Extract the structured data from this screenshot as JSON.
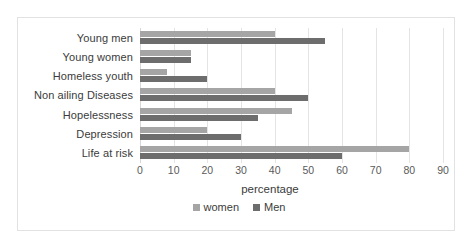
{
  "chart_data": {
    "type": "bar",
    "orientation": "horizontal",
    "title": "",
    "xlabel": "percentage",
    "ylabel": "",
    "xlim": [
      0,
      90
    ],
    "xticks": [
      0,
      10,
      20,
      30,
      40,
      50,
      60,
      70,
      80,
      90
    ],
    "grid": "vertical",
    "legend_position": "bottom",
    "categories": [
      "Young men",
      "Young women",
      "Homeless youth",
      "Non ailing Diseases",
      "Hopelessness",
      "Depression",
      "Life at risk"
    ],
    "series": [
      {
        "name": "women",
        "color": "#a5a5a5",
        "values": [
          40,
          15,
          8,
          40,
          45,
          20,
          80
        ]
      },
      {
        "name": "Men",
        "color": "#6d6d6d",
        "values": [
          55,
          15,
          20,
          50,
          35,
          30,
          60
        ]
      }
    ]
  },
  "legend": {
    "entries": [
      {
        "label": "women"
      },
      {
        "label": "Men"
      }
    ]
  },
  "axis": {
    "title": "percentage"
  }
}
